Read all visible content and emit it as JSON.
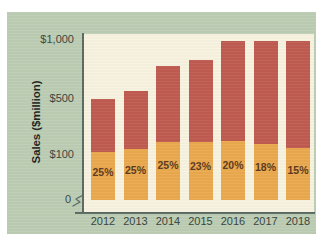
{
  "chart_data": {
    "type": "bar",
    "subtype": "stacked-bar",
    "title": "",
    "xlabel": "",
    "ylabel": "Sales ($million)",
    "categories": [
      "2012",
      "2013",
      "2014",
      "2015",
      "2016",
      "2017",
      "2018"
    ],
    "ytick_labels": [
      "0",
      "$100",
      "$500",
      "$1,000"
    ],
    "ytick_values": [
      0,
      100,
      500,
      1000
    ],
    "ylim": [
      0,
      1100
    ],
    "y_axis_broken": true,
    "grid": false,
    "legend": "none",
    "series": [
      {
        "name": "lower-segment",
        "color": "#eaa94e",
        "values": [
          125,
          143,
          195,
          191,
          198,
          178,
          149
        ],
        "data_labels": [
          "25%",
          "25%",
          "25%",
          "23%",
          "20%",
          "18%",
          "15%"
        ]
      },
      {
        "name": "upper-segment",
        "color": "#c05b51",
        "values": [
          375,
          427,
          585,
          639,
          792,
          812,
          846
        ]
      }
    ],
    "totals": [
      500,
      570,
      780,
      830,
      990,
      990,
      995
    ],
    "bars": [
      {
        "category": "2012",
        "total": 500,
        "lower": 125,
        "upper": 375,
        "pct": "25%"
      },
      {
        "category": "2013",
        "total": 570,
        "lower": 143,
        "upper": 427,
        "pct": "25%"
      },
      {
        "category": "2014",
        "total": 780,
        "lower": 195,
        "upper": 585,
        "pct": "25%"
      },
      {
        "category": "2015",
        "total": 830,
        "lower": 191,
        "upper": 639,
        "pct": "23%"
      },
      {
        "category": "2016",
        "total": 990,
        "lower": 198,
        "upper": 792,
        "pct": "20%"
      },
      {
        "category": "2017",
        "total": 990,
        "lower": 178,
        "upper": 812,
        "pct": "18%"
      },
      {
        "category": "2018",
        "total": 995,
        "lower": 149,
        "upper": 846,
        "pct": "15%"
      }
    ]
  },
  "colors": {
    "panel_background": "#bdcdb4",
    "plot_background": "#f8f3df",
    "axis": "#5a6b63",
    "lower_segment": "#eaa94e",
    "upper_segment": "#c05b51",
    "tick_text": "#394540",
    "label_text": "#5d3a20"
  }
}
